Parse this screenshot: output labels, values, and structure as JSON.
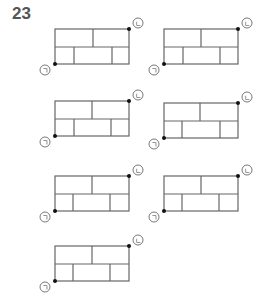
{
  "question_number": "23",
  "labels": {
    "start": "ㄱ",
    "end": "ㄴ"
  },
  "colors": {
    "grid": "#666666",
    "path": "#111111",
    "text": "#555555"
  },
  "figures": [
    {
      "id": 1,
      "x": 55,
      "y": 29,
      "top_dividers": [
        93
      ],
      "bottom_dividers": [
        74,
        112
      ]
    },
    {
      "id": 2,
      "x": 164,
      "y": 29,
      "top_dividers": [
        201
      ],
      "bottom_dividers": [
        183,
        220
      ]
    },
    {
      "id": 3,
      "x": 55,
      "y": 101,
      "top_dividers": [
        92
      ],
      "bottom_dividers": [
        74,
        111
      ]
    },
    {
      "id": 4,
      "x": 164,
      "y": 103,
      "top_dividers": [
        200
      ],
      "bottom_dividers": [
        182,
        220
      ]
    },
    {
      "id": 5,
      "x": 55,
      "y": 176,
      "top_dividers": [
        92
      ],
      "bottom_dividers": [
        73,
        110
      ]
    },
    {
      "id": 6,
      "x": 164,
      "y": 176,
      "top_dividers": [
        201
      ],
      "bottom_dividers": [
        182,
        219
      ]
    },
    {
      "id": 7,
      "x": 55,
      "y": 246,
      "top_dividers": [
        92
      ],
      "bottom_dividers": [
        73,
        110
      ]
    }
  ]
}
